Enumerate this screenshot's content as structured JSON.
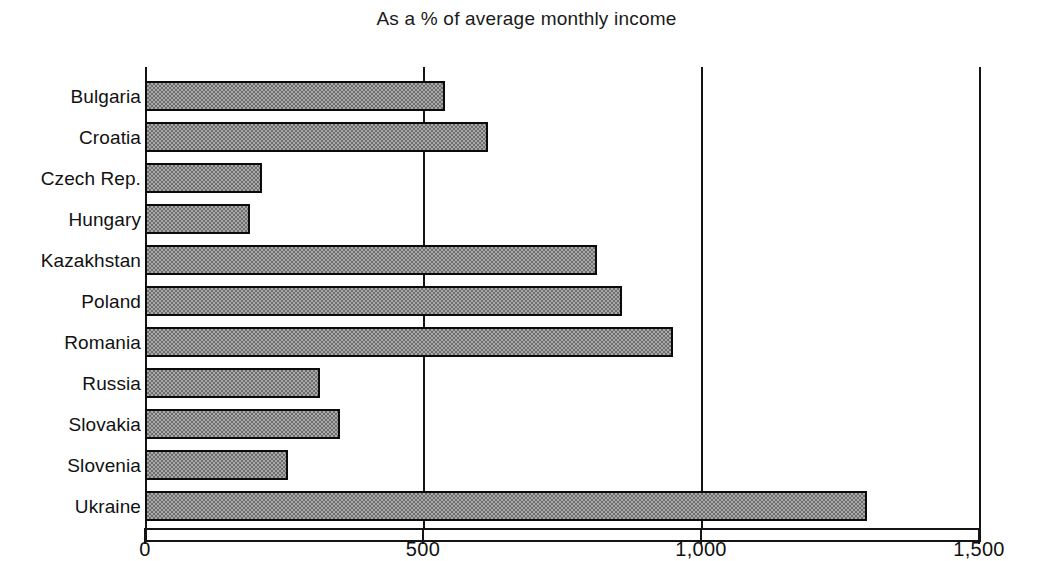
{
  "chart_data": {
    "type": "bar",
    "orientation": "horizontal",
    "title": "As a % of average monthly income",
    "subtitle": "",
    "xlabel": "",
    "ylabel": "",
    "xlim": [
      0,
      1500
    ],
    "grid": true,
    "legend": null,
    "xticks": [
      {
        "value": 0,
        "label": "0"
      },
      {
        "value": 500,
        "label": "500"
      },
      {
        "value": 1000,
        "label": "1,000"
      },
      {
        "value": 1500,
        "label": "1,500"
      }
    ],
    "categories": [
      "Bulgaria",
      "Croatia",
      "Czech Rep.",
      "Hungary",
      "Kazakhstan",
      "Poland",
      "Romania",
      "Russia",
      "Slovakia",
      "Slovenia",
      "Ukraine"
    ],
    "values": [
      539,
      617,
      210,
      189,
      813,
      858,
      949,
      315,
      351,
      257,
      1298
    ],
    "bars": [
      {
        "category": "Bulgaria",
        "value": 539
      },
      {
        "category": "Croatia",
        "value": 617
      },
      {
        "category": "Czech Rep.",
        "value": 210
      },
      {
        "category": "Hungary",
        "value": 189
      },
      {
        "category": "Kazakhstan",
        "value": 813
      },
      {
        "category": "Poland",
        "value": 858
      },
      {
        "category": "Romania",
        "value": 949
      },
      {
        "category": "Russia",
        "value": 315
      },
      {
        "category": "Slovakia",
        "value": 351
      },
      {
        "category": "Slovenia",
        "value": 257
      },
      {
        "category": "Ukraine",
        "value": 1298
      }
    ],
    "colors": {
      "bar_fill": "#a9a9a9",
      "bar_hatch": "#6d6d6d",
      "bar_edge": "#0b0b0b",
      "axis": "#141414",
      "background": "#ffffff",
      "text": "#111111"
    }
  }
}
